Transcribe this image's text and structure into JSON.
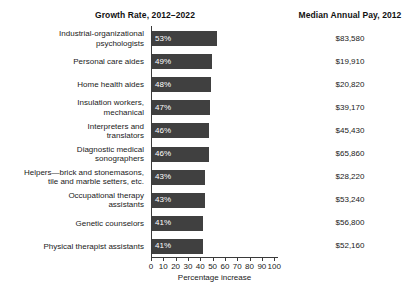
{
  "headers": {
    "growth": "Growth Rate, 2012–2022",
    "pay": "Median Annual Pay, 2012"
  },
  "chart_data": {
    "type": "bar",
    "title": "Growth Rate, 2012–2022",
    "xlabel": "Percentage increase",
    "ylabel": "",
    "orientation": "horizontal",
    "xlim": [
      0,
      100
    ],
    "xticks": [
      0,
      10,
      20,
      30,
      40,
      50,
      60,
      70,
      80,
      90,
      100
    ],
    "grid": false,
    "legend": null,
    "bar_color": "#404040",
    "categories": [
      "Industrial-organizational psychologists",
      "Personal care aides",
      "Home health aides",
      "Insulation workers, mechanical",
      "Interpreters and translators",
      "Diagnostic medical sonographers",
      "Helpers—brick and stonemasons, tile and marble setters, etc.",
      "Occupational therapy assistants",
      "Genetic counselors",
      "Physical therapist assistants"
    ],
    "values": [
      53,
      49,
      48,
      47,
      46,
      46,
      43,
      43,
      41,
      41
    ],
    "value_labels": [
      "53%",
      "49%",
      "48%",
      "47%",
      "46%",
      "46%",
      "43%",
      "43%",
      "41%",
      "41%"
    ],
    "secondary_series": {
      "name": "Median Annual Pay, 2012",
      "labels": [
        "$83,580",
        "$19,910",
        "$20,820",
        "$39,170",
        "$45,430",
        "$65,860",
        "$28,220",
        "$53,240",
        "$56,800",
        "$52,160"
      ],
      "values": [
        83580,
        19910,
        20820,
        39170,
        45430,
        65860,
        28220,
        53240,
        56800,
        52160
      ]
    }
  },
  "rows": [
    {
      "label_lines": [
        "Industrial-organizational",
        "psychologists"
      ],
      "value": 53,
      "value_label": "53%",
      "pay": "$83,580"
    },
    {
      "label_lines": [
        "Personal care aides"
      ],
      "value": 49,
      "value_label": "49%",
      "pay": "$19,910"
    },
    {
      "label_lines": [
        "Home health aides"
      ],
      "value": 48,
      "value_label": "48%",
      "pay": "$20,820"
    },
    {
      "label_lines": [
        "Insulation workers,",
        "mechanical"
      ],
      "value": 47,
      "value_label": "47%",
      "pay": "$39,170"
    },
    {
      "label_lines": [
        "Interpreters and",
        "translators"
      ],
      "value": 46,
      "value_label": "46%",
      "pay": "$45,430"
    },
    {
      "label_lines": [
        "Diagnostic medical",
        "sonographers"
      ],
      "value": 46,
      "value_label": "46%",
      "pay": "$65,860"
    },
    {
      "label_lines": [
        "Helpers—brick and stonemasons,",
        "tile and marble setters, etc."
      ],
      "value": 43,
      "value_label": "43%",
      "pay": "$28,220"
    },
    {
      "label_lines": [
        "Occupational therapy",
        "assistants"
      ],
      "value": 43,
      "value_label": "43%",
      "pay": "$53,240"
    },
    {
      "label_lines": [
        "Genetic counselors"
      ],
      "value": 41,
      "value_label": "41%",
      "pay": "$56,800"
    },
    {
      "label_lines": [
        "Physical therapist assistants"
      ],
      "value": 41,
      "value_label": "41%",
      "pay": "$52,160"
    }
  ],
  "axis": {
    "ticks": [
      "0",
      "10",
      "20",
      "30",
      "40",
      "50",
      "60",
      "70",
      "80",
      "90",
      "100"
    ],
    "label": "Percentage increase"
  }
}
